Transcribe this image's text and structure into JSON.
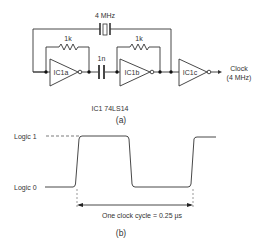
{
  "circuit": {
    "crystal_label": "4 MHz",
    "resistor1_label": "1k",
    "resistor2_label": "1k",
    "capacitor_label": "1n",
    "gates": [
      "IC1a",
      "IC1b",
      "IC1c"
    ],
    "output_label_line1": "Clock",
    "output_label_line2": "(4 MHz)",
    "ic_note": "IC1 74LS14",
    "caption": "(a)"
  },
  "waveform": {
    "logic_high_label": "Logic 1",
    "logic_low_label": "Logic 0",
    "period_label": "One clock cycle = 0.25 µs",
    "caption": "(b)"
  }
}
